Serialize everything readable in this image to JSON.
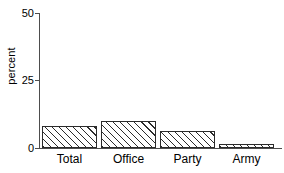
{
  "chart_data": {
    "type": "bar",
    "title": "",
    "xlabel": "",
    "ylabel": "percent",
    "categories": [
      "Total",
      "Office",
      "Party",
      "Army"
    ],
    "values": [
      8,
      10,
      6.3,
      1.5
    ],
    "ylim": [
      0,
      50
    ],
    "yticks": [
      0,
      25,
      50
    ],
    "ytick_labels": [
      "0",
      "25",
      "50"
    ],
    "grid": false,
    "legend": false,
    "bar_style": {
      "fill": "#ffffff",
      "edge_color": "#2b2b2b",
      "hatch": "diagonal-forward"
    },
    "axis_color": "#4d4d4d"
  }
}
